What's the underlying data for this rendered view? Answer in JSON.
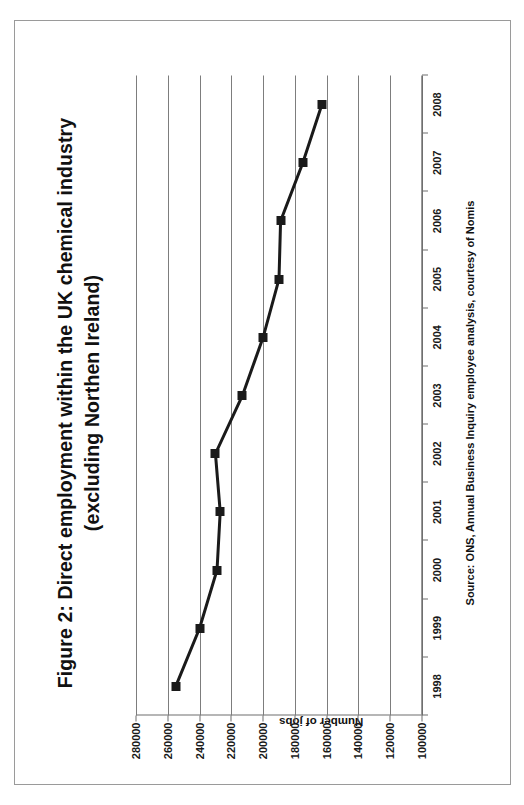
{
  "figure": {
    "title_line1": "Figure 2: Direct employment within the UK chemical industry",
    "title_line2": "(excluding Northen Ireland)",
    "source": "Source: ONS, Annual Business Inquiry employee analysis, courtesy of Nomis"
  },
  "chart_data": {
    "type": "line",
    "title": "Figure 2: Direct employment within the UK chemical industry (excluding Northen Ireland)",
    "xlabel": "",
    "ylabel": "Number of jobs",
    "categories": [
      "1998",
      "1999",
      "2000",
      "2001",
      "2002",
      "2003",
      "2004",
      "2005",
      "2006",
      "2007",
      "2008"
    ],
    "values": [
      255000,
      240000,
      229000,
      227000,
      230000,
      213000,
      200000,
      190000,
      189000,
      175000,
      163000
    ],
    "series": [
      {
        "name": "Number of jobs",
        "values": [
          255000,
          240000,
          229000,
          227000,
          230000,
          213000,
          200000,
          190000,
          189000,
          175000,
          163000
        ]
      }
    ],
    "ylim": [
      100000,
      280000
    ],
    "ytick_labels": [
      "280000",
      "260000",
      "240000",
      "220000",
      "200000",
      "180000",
      "160000",
      "140000",
      "120000",
      "100000"
    ],
    "ytick_values": [
      280000,
      260000,
      240000,
      220000,
      200000,
      180000,
      160000,
      140000,
      120000,
      100000
    ],
    "xtick_labels": [
      "1998",
      "1999",
      "2000",
      "2001",
      "2002",
      "2003",
      "2004",
      "2005",
      "2006",
      "2007",
      "2008"
    ],
    "grid": "value-axis gridlines only",
    "legend": "none",
    "marker": "filled square",
    "line_color": "#1a1a1a",
    "grid_color": "#7d7d7d",
    "background": "#ffffff",
    "rotation_degrees": -90
  }
}
